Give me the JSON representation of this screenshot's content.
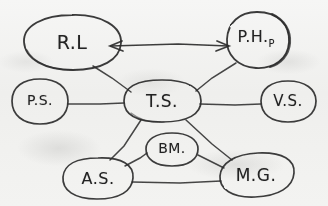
{
  "diagram": {
    "medium": "pencil sketch on paper",
    "ink_color": "#2b2b2b",
    "paper_color": "#f2f2f0",
    "nodes": [
      {
        "id": "rl",
        "label": "R.L",
        "sublabel": "",
        "shape": "ellipse",
        "cx": 72,
        "cy": 42,
        "rx": 48,
        "ry": 27,
        "rot": -4,
        "font_size": 19
      },
      {
        "id": "ph",
        "label": "P.H.",
        "sublabel": "P",
        "shape": "ellipse",
        "cx": 257,
        "cy": 40,
        "rx": 32,
        "ry": 28,
        "rot": 12,
        "font_size": 16
      },
      {
        "id": "ps",
        "label": "P.S.",
        "sublabel": "",
        "shape": "ellipse",
        "cx": 40,
        "cy": 101,
        "rx": 28,
        "ry": 23,
        "rot": 0,
        "font_size": 14
      },
      {
        "id": "ts",
        "label": "T.S.",
        "sublabel": "",
        "shape": "ellipse",
        "cx": 162,
        "cy": 101,
        "rx": 38,
        "ry": 22,
        "rot": 0,
        "font_size": 17
      },
      {
        "id": "vs",
        "label": "V.S.",
        "sublabel": "",
        "shape": "ellipse",
        "cx": 288,
        "cy": 101,
        "rx": 27,
        "ry": 21,
        "rot": 0,
        "font_size": 15
      },
      {
        "id": "bm",
        "label": "BM.",
        "sublabel": "",
        "shape": "ellipse",
        "cx": 172,
        "cy": 149,
        "rx": 27,
        "ry": 17,
        "rot": 0,
        "font_size": 14
      },
      {
        "id": "as",
        "label": "A.S.",
        "sublabel": "",
        "shape": "ellipse",
        "cx": 98,
        "cy": 178,
        "rx": 35,
        "ry": 20,
        "rot": -3,
        "font_size": 16
      },
      {
        "id": "mg",
        "label": "M.G.",
        "sublabel": "",
        "shape": "ellipse",
        "cx": 256,
        "cy": 175,
        "rx": 38,
        "ry": 20,
        "rot": -8,
        "font_size": 17
      }
    ],
    "edges": [
      {
        "id": "rl-ph",
        "from": "rl",
        "to": "ph",
        "arrow": "both",
        "label": ""
      },
      {
        "id": "rl-ts",
        "from": "rl",
        "to": "ts",
        "arrow": "none",
        "label": ""
      },
      {
        "id": "ph-ts",
        "from": "ph",
        "to": "ts",
        "arrow": "none",
        "label": ""
      },
      {
        "id": "ps-ts",
        "from": "ps",
        "to": "ts",
        "arrow": "none",
        "label": ""
      },
      {
        "id": "ts-vs",
        "from": "ts",
        "to": "vs",
        "arrow": "none",
        "label": ""
      },
      {
        "id": "ts-as",
        "from": "ts",
        "to": "as",
        "arrow": "none",
        "label": ""
      },
      {
        "id": "ts-mg",
        "from": "ts",
        "to": "mg",
        "arrow": "none",
        "label": ""
      },
      {
        "id": "as-bm",
        "from": "as",
        "to": "bm",
        "arrow": "none",
        "label": ""
      },
      {
        "id": "bm-mg",
        "from": "bm",
        "to": "mg",
        "arrow": "none",
        "label": ""
      },
      {
        "id": "as-mg",
        "from": "as",
        "to": "mg",
        "arrow": "none",
        "label": ""
      }
    ]
  }
}
